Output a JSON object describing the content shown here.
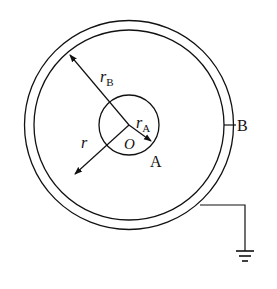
{
  "diagram": {
    "labels": {
      "rB": {
        "main": "r",
        "sub": "B"
      },
      "rA": {
        "main": "r",
        "sub": "A"
      },
      "r": "r",
      "O": "O",
      "A": "A",
      "B": "B"
    },
    "colors": {
      "stroke": "#111111",
      "background": "#ffffff"
    },
    "components": [
      "outer conducting shell B",
      "inner sphere A",
      "ground connection"
    ]
  }
}
